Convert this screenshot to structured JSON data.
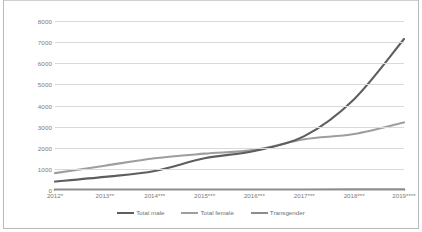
{
  "chart_data": {
    "type": "line",
    "title": "",
    "subtitle": "",
    "xlabel": "",
    "ylabel": "",
    "ylim": [
      0,
      8000
    ],
    "ytick_labels": [
      "0",
      "1000",
      "2000",
      "3000",
      "4000",
      "5000",
      "6000",
      "7000",
      "8000"
    ],
    "ytick_values": [
      0,
      1000,
      2000,
      3000,
      4000,
      5000,
      6000,
      7000,
      8000
    ],
    "grid": true,
    "legend_position": "bottom",
    "categories": [
      "2012*",
      "2013**",
      "2014***",
      "2015***",
      "2016***",
      "2017***",
      "2018***",
      "2019****"
    ],
    "series": [
      {
        "name": "Total male",
        "color": "#5e5e5e",
        "values": [
          400,
          620,
          900,
          1500,
          1850,
          2550,
          4300,
          7150
        ]
      },
      {
        "name": "Total female",
        "color": "#9e9e9e",
        "values": [
          800,
          1150,
          1500,
          1720,
          1900,
          2400,
          2650,
          3200
        ]
      },
      {
        "name": "Transgender",
        "color": "#8c8c8c",
        "values": [
          10,
          10,
          12,
          12,
          14,
          14,
          16,
          18
        ]
      }
    ]
  },
  "legend": {
    "items": [
      {
        "label": "Total male",
        "color": "#5e5e5e"
      },
      {
        "label": "Total female",
        "color": "#9e9e9e"
      },
      {
        "label": "Transgender",
        "color": "#8c8c8c"
      }
    ]
  },
  "axes": {
    "y_labels": [
      "8000",
      "7000",
      "6000",
      "5000",
      "4000",
      "3000",
      "2000",
      "1000",
      "0"
    ],
    "x_labels": [
      "2012*",
      "2013**",
      "2014***",
      "2015***",
      "2016***",
      "2017***",
      "2018***",
      "2019****"
    ]
  },
  "colors": {
    "grid": "#d9d9d9",
    "axis_text": "#7b7b7b",
    "background": "#ffffff",
    "frame": "#b9b9b9"
  }
}
